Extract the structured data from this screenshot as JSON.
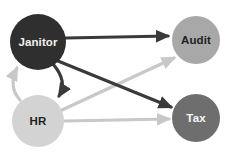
{
  "diagram": {
    "type": "directed-graph",
    "background_color": "#ffffff",
    "nodes": [
      {
        "id": "janitor",
        "label": "Janitor",
        "cx": 38,
        "cy": 42,
        "r": 28,
        "fill": "#2f2f2f",
        "text_color": "#f2f2f2"
      },
      {
        "id": "audit",
        "label": "Audit",
        "cx": 196,
        "cy": 40,
        "r": 24,
        "fill": "#a8a8a8",
        "text_color": "#1f1f1f"
      },
      {
        "id": "hr",
        "label": "HR",
        "cx": 38,
        "cy": 121,
        "r": 26,
        "fill": "#d3d3d3",
        "text_color": "#1f1f1f"
      },
      {
        "id": "tax",
        "label": "Tax",
        "cx": 196,
        "cy": 118,
        "r": 24,
        "fill": "#6e6e6e",
        "text_color": "#f7f7f7"
      }
    ],
    "edges": [
      {
        "id": "janitor-audit",
        "from": "Janitor",
        "to": "Audit",
        "color": "#3a3a3a",
        "width": 3.2,
        "style": "straight",
        "path": "M 66 38 L 168 36"
      },
      {
        "id": "janitor-tax",
        "from": "Janitor",
        "to": "Tax",
        "color": "#3a3a3a",
        "width": 3.2,
        "style": "straight",
        "path": "M 58 61 L 171 107"
      },
      {
        "id": "janitor-hr",
        "from": "Janitor",
        "to": "HR",
        "color": "#3a3a3a",
        "width": 3.2,
        "style": "curved",
        "path": "M 53 64 C 65 78 64 88 59 96"
      },
      {
        "id": "hr-janitor",
        "from": "HR",
        "to": "Janitor",
        "color": "#c8c8c8",
        "width": 3.2,
        "style": "curved",
        "path": "M 20 100 C 11 90 12 78 17 68"
      },
      {
        "id": "hr-audit",
        "from": "HR",
        "to": "Audit",
        "color": "#c8c8c8",
        "width": 3.2,
        "style": "straight",
        "path": "M 62 110 L 174 58"
      },
      {
        "id": "hr-tax",
        "from": "HR",
        "to": "Tax",
        "color": "#c8c8c8",
        "width": 3.2,
        "style": "straight",
        "path": "M 64 121 L 169 119"
      }
    ]
  }
}
